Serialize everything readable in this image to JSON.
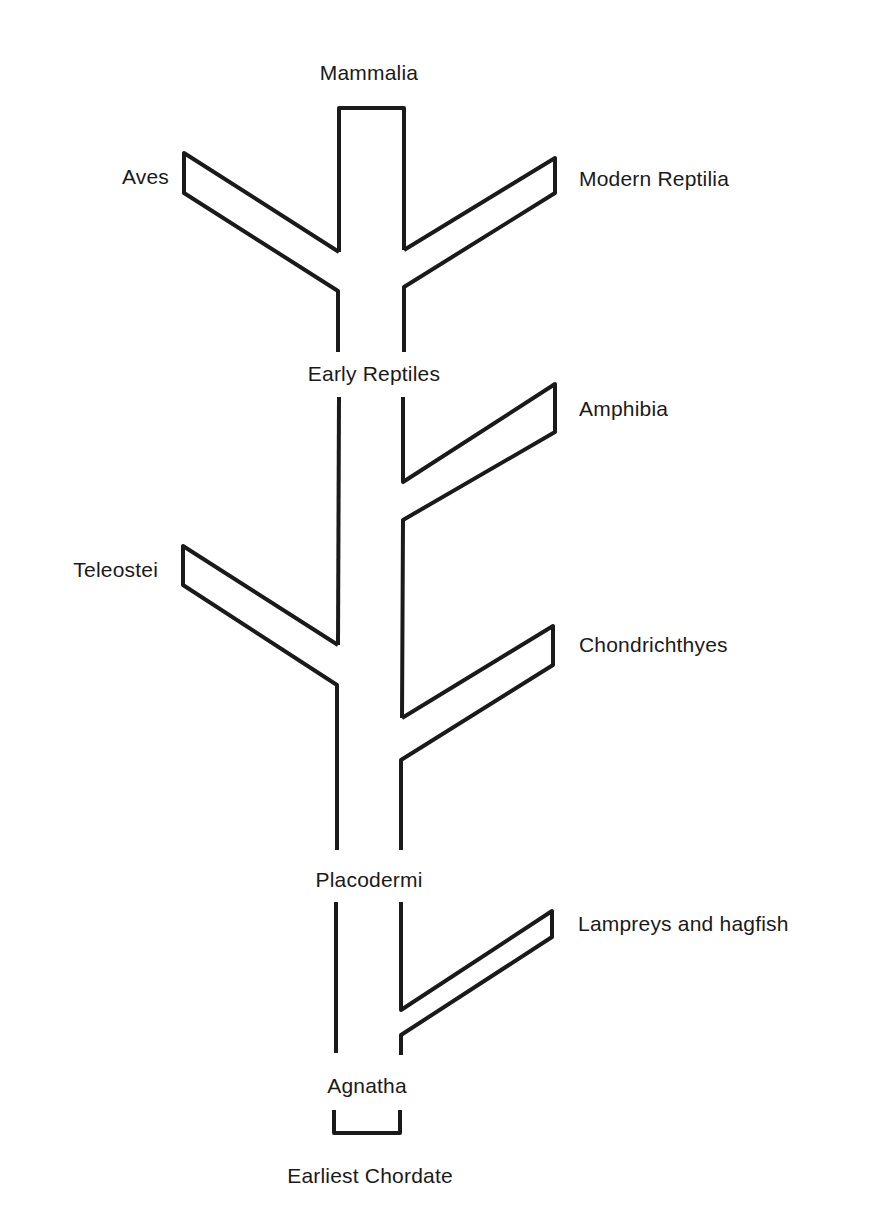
{
  "diagram": {
    "title": "",
    "type": "phylogenetic-tree",
    "trunk_label_top": "Mammalia",
    "root_label": "Earliest Chordate",
    "nodes": [
      {
        "id": "mammalia",
        "label": "Mammalia",
        "position": "top"
      },
      {
        "id": "aves",
        "label": "Aves",
        "side": "left"
      },
      {
        "id": "modern-reptilia",
        "label": "Modern Reptilia",
        "side": "right"
      },
      {
        "id": "early-reptiles",
        "label": "Early Reptiles",
        "position": "trunk"
      },
      {
        "id": "amphibia",
        "label": "Amphibia",
        "side": "right"
      },
      {
        "id": "teleostei",
        "label": "Teleostei",
        "side": "left"
      },
      {
        "id": "chondrichthyes",
        "label": "Chondrichthyes",
        "side": "right"
      },
      {
        "id": "placodermi",
        "label": "Placodermi",
        "position": "trunk"
      },
      {
        "id": "lampreys-and-hagfish",
        "label": "Lampreys and hagfish",
        "side": "right"
      },
      {
        "id": "agnatha",
        "label": "Agnatha",
        "position": "trunk"
      },
      {
        "id": "earliest-chordate",
        "label": "Earliest Chordate",
        "position": "root"
      }
    ],
    "edges": [
      {
        "from": "earliest-chordate",
        "to": "agnatha"
      },
      {
        "from": "agnatha",
        "to": "lampreys-and-hagfish"
      },
      {
        "from": "agnatha",
        "to": "placodermi"
      },
      {
        "from": "placodermi",
        "to": "chondrichthyes"
      },
      {
        "from": "placodermi",
        "to": "teleostei"
      },
      {
        "from": "placodermi",
        "to": "amphibia"
      },
      {
        "from": "amphibia",
        "to": "early-reptiles"
      },
      {
        "from": "early-reptiles",
        "to": "aves"
      },
      {
        "from": "early-reptiles",
        "to": "modern-reptilia"
      },
      {
        "from": "early-reptiles",
        "to": "mammalia"
      }
    ]
  },
  "labels": {
    "mammalia": "Mammalia",
    "aves": "Aves",
    "modern_reptilia": "Modern Reptilia",
    "early_reptiles": "Early Reptiles",
    "amphibia": "Amphibia",
    "teleostei": "Teleostei",
    "chondrichthyes": "Chondrichthyes",
    "placodermi": "Placodermi",
    "lampreys_and_hagfish": "Lampreys and hagfish",
    "agnatha": "Agnatha",
    "earliest_chordate": "Earliest Chordate"
  },
  "colors": {
    "stroke": "#1a1a1a",
    "background": "#ffffff"
  }
}
